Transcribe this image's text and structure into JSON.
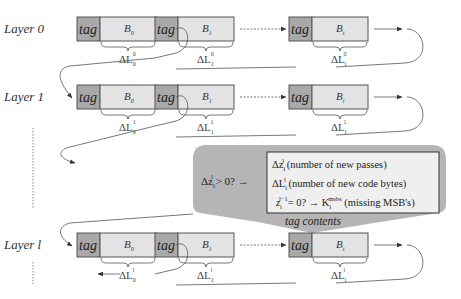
{
  "diagram": {
    "colors": {
      "tag_fill": "#a9a9a9",
      "block_fill": "#e3e3e3",
      "border": "#555555",
      "callout_fill": "#b5b5b5",
      "inner_box_fill": "#efefef",
      "line": "#555555"
    },
    "layers": [
      {
        "label": "Layer 0",
        "superscript": "0",
        "blocks": [
          {
            "tag": "tag",
            "body": "B",
            "body_sub": "0",
            "delta": "ΔL",
            "delta_sub": "0"
          },
          {
            "tag": "tag",
            "body": "B",
            "body_sub": "1",
            "delta": "ΔL",
            "delta_sub": "1"
          },
          {
            "tag": "tag",
            "body": "B",
            "body_sub": "i",
            "delta": "ΔL",
            "delta_sub": "i"
          }
        ]
      },
      {
        "label": "Layer 1",
        "superscript": "1",
        "blocks": [
          {
            "tag": "tag",
            "body": "B",
            "body_sub": "0",
            "delta": "ΔL",
            "delta_sub": "0"
          },
          {
            "tag": "tag",
            "body": "B",
            "body_sub": "1",
            "delta": "ΔL",
            "delta_sub": "1"
          },
          {
            "tag": "tag",
            "body": "B",
            "body_sub": "i",
            "delta": "ΔL",
            "delta_sub": "i"
          }
        ]
      },
      {
        "label": "Layer l",
        "superscript": "l",
        "blocks": [
          {
            "tag": "tag",
            "body": "B",
            "body_sub": "0",
            "delta": "ΔL",
            "delta_sub": "0"
          },
          {
            "tag": "tag",
            "body": "B",
            "body_sub": "1",
            "delta": "ΔL",
            "delta_sub": "1"
          },
          {
            "tag": "tag",
            "body": "B",
            "body_sub": "i",
            "delta": "ΔL",
            "delta_sub": "i"
          }
        ]
      }
    ],
    "callout": {
      "condition": "Δz",
      "condition_sub": "i",
      "condition_sup": "l",
      "condition_rest": " > 0? →",
      "lines": [
        {
          "sym": "Δz",
          "sub": "i",
          "sup": "l",
          "text": " (number of new passes)"
        },
        {
          "sym": "ΔL",
          "sub": "i",
          "sup": "l",
          "text": " (number of new code bytes)"
        },
        {
          "sym": "z",
          "sub": "i",
          "sup": "l−1",
          "mid": "= 0? → K",
          "mid_sub": "i",
          "mid_sup": "msbs",
          "text": " (missing MSB's)"
        }
      ],
      "caption": "tag contents"
    }
  }
}
